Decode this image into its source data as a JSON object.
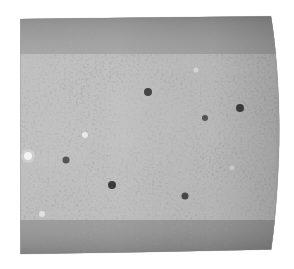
{
  "image": {
    "title": "Grayscale speckle-textured cylindrical specimen",
    "domain": "natural-image",
    "width": 294,
    "height": 269,
    "background_color": "#ffffff",
    "subject": "cylinder-speckle-texture",
    "has_text": false,
    "has_axes": false,
    "has_legend": false,
    "caption": ""
  },
  "shape": {
    "name": "cylinder-body",
    "description": "Near-rectangular slab with a straight left edge and a convex bulging right edge, suggesting a cylinder viewed side-on",
    "left_edge_x": 20,
    "right_edge_x_top": 272,
    "right_edge_x_mid": 280,
    "right_edge_x_bottom": 271,
    "top_edge_y_left": 19,
    "top_edge_y_right": 16,
    "bottom_edge_y_left": 254,
    "bottom_edge_y_right": 249,
    "right_bulge_amount_px": 9,
    "corner_style": "soft-squared"
  },
  "texture": {
    "name": "speckle-noise",
    "type": "isotropic-speckle",
    "mean_gray": "#6b6b6b",
    "dark_value": "#0d0d0d",
    "light_value": "#f2f2f2",
    "blob_diameter_px": 6,
    "contrast": "high",
    "grain": "fine"
  },
  "bands": {
    "top": {
      "name": "top-anisotropic-band",
      "y_start": 16,
      "y_end": 52,
      "style": "horizontally-streaked",
      "mean_gray": "#5f5f5f",
      "stretch_x": 3.2
    },
    "middle": {
      "name": "central-speckle-band",
      "y_start": 52,
      "y_end": 222,
      "style": "isotropic-speckle",
      "mean_gray": "#6e6e6e",
      "stretch_x": 1.0
    },
    "bottom": {
      "name": "bottom-anisotropic-band",
      "y_start": 222,
      "y_end": 254,
      "style": "horizontally-streaked",
      "mean_gray": "#575757",
      "stretch_x": 3.0
    }
  },
  "highlights": [
    {
      "name": "bright-speckle-left",
      "x": 28,
      "y": 156,
      "radius": 4,
      "color": "#f5f5f5"
    },
    {
      "name": "bright-speckle-center",
      "x": 85,
      "y": 135,
      "radius": 3,
      "color": "#ededed"
    },
    {
      "name": "bright-speckle-lower-left",
      "x": 42,
      "y": 214,
      "radius": 3,
      "color": "#e8e8e8"
    },
    {
      "name": "dark-blob-center",
      "x": 112,
      "y": 185,
      "radius": 4,
      "color": "#101010"
    },
    {
      "name": "dark-blob-upper",
      "x": 148,
      "y": 92,
      "radius": 4,
      "color": "#141414"
    },
    {
      "name": "dark-blob-right",
      "x": 240,
      "y": 108,
      "radius": 4,
      "color": "#121212"
    }
  ]
}
